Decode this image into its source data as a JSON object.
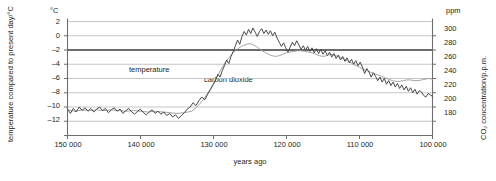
{
  "chart_data": {
    "type": "line",
    "title": "",
    "xlabel": "years ago",
    "x_tick_labels": [
      "150 000",
      "140 000",
      "130 000",
      "120 000",
      "110 000",
      "100 000"
    ],
    "x_ticks": [
      150000,
      140000,
      130000,
      120000,
      110000,
      100000
    ],
    "xlim": [
      150000,
      100000
    ],
    "x_direction": "decreasing",
    "grid": true,
    "legend_position": "inline-annotations",
    "axes": {
      "left": {
        "unit": "°C",
        "label": "temperature compared to present day/°C",
        "tick_labels": [
          "2",
          "0",
          "–2",
          "–4",
          "–6",
          "–8",
          "–10",
          "–12"
        ],
        "ticks": [
          2,
          0,
          -2,
          -4,
          -6,
          -8,
          -10,
          -12
        ],
        "ylim": [
          -12,
          4
        ]
      },
      "right": {
        "unit": "ppm",
        "label": "CO₂ concentration/p.p.m.",
        "tick_labels": [
          "300",
          "280",
          "260",
          "240",
          "220",
          "200",
          "180"
        ],
        "ticks": [
          300,
          280,
          260,
          240,
          220,
          200,
          180
        ],
        "ylim": [
          160,
          320
        ]
      }
    },
    "annotations": [
      {
        "text": "temperature",
        "x": 133000,
        "y": -4.2
      },
      {
        "text": "carbon dioxide",
        "x": 128400,
        "y": -5.0
      }
    ],
    "series": [
      {
        "name": "temperature",
        "unit": "°C",
        "axis": "left",
        "color": "#4a4a4a",
        "points": [
          [
            150000,
            -8.3
          ],
          [
            149600,
            -8.9
          ],
          [
            149200,
            -8.2
          ],
          [
            148800,
            -8.7
          ],
          [
            148400,
            -8.0
          ],
          [
            148000,
            -8.5
          ],
          [
            147600,
            -8.1
          ],
          [
            147200,
            -8.6
          ],
          [
            146800,
            -8.2
          ],
          [
            146400,
            -8.7
          ],
          [
            146000,
            -8.3
          ],
          [
            145600,
            -8.0
          ],
          [
            145200,
            -8.5
          ],
          [
            144800,
            -8.2
          ],
          [
            144400,
            -8.8
          ],
          [
            144000,
            -8.4
          ],
          [
            143600,
            -8.1
          ],
          [
            143200,
            -8.6
          ],
          [
            142800,
            -8.3
          ],
          [
            142400,
            -8.9
          ],
          [
            142000,
            -8.5
          ],
          [
            141600,
            -8.2
          ],
          [
            141200,
            -8.7
          ],
          [
            140800,
            -9.0
          ],
          [
            140400,
            -8.6
          ],
          [
            140000,
            -8.3
          ],
          [
            139600,
            -8.8
          ],
          [
            139200,
            -9.1
          ],
          [
            138800,
            -8.7
          ],
          [
            138400,
            -8.4
          ],
          [
            138000,
            -8.9
          ],
          [
            137600,
            -8.6
          ],
          [
            137200,
            -9.0
          ],
          [
            136800,
            -8.7
          ],
          [
            136400,
            -9.2
          ],
          [
            136000,
            -8.9
          ],
          [
            135600,
            -9.4
          ],
          [
            135200,
            -9.1
          ],
          [
            134800,
            -9.6
          ],
          [
            134400,
            -9.2
          ],
          [
            134000,
            -8.8
          ],
          [
            133600,
            -8.3
          ],
          [
            133200,
            -8.0
          ],
          [
            132800,
            -7.4
          ],
          [
            132400,
            -7.8
          ],
          [
            132000,
            -7.1
          ],
          [
            131600,
            -6.6
          ],
          [
            131200,
            -7.0
          ],
          [
            130800,
            -6.2
          ],
          [
            130400,
            -5.5
          ],
          [
            130000,
            -4.8
          ],
          [
            129700,
            -4.2
          ],
          [
            129400,
            -3.4
          ],
          [
            129100,
            -3.8
          ],
          [
            128800,
            -2.9
          ],
          [
            128500,
            -2.2
          ],
          [
            128200,
            -1.4
          ],
          [
            127900,
            -1.9
          ],
          [
            127600,
            -0.9
          ],
          [
            127300,
            -0.2
          ],
          [
            127000,
            0.6
          ],
          [
            126700,
            1.4
          ],
          [
            126400,
            0.8
          ],
          [
            126100,
            1.9
          ],
          [
            125800,
            2.6
          ],
          [
            125500,
            2.1
          ],
          [
            125200,
            2.9
          ],
          [
            124900,
            2.3
          ],
          [
            124600,
            3.1
          ],
          [
            124300,
            2.5
          ],
          [
            124000,
            1.9
          ],
          [
            123700,
            2.6
          ],
          [
            123400,
            3.0
          ],
          [
            123100,
            2.3
          ],
          [
            122800,
            2.8
          ],
          [
            122500,
            2.2
          ],
          [
            122200,
            2.7
          ],
          [
            121900,
            2.0
          ],
          [
            121600,
            2.5
          ],
          [
            121300,
            1.7
          ],
          [
            121000,
            1.1
          ],
          [
            120700,
            0.5
          ],
          [
            120400,
            1.0
          ],
          [
            120100,
            0.3
          ],
          [
            119800,
            -0.3
          ],
          [
            119500,
            0.4
          ],
          [
            119200,
            1.1
          ],
          [
            118900,
            0.6
          ],
          [
            118600,
            1.3
          ],
          [
            118300,
            0.7
          ],
          [
            118000,
            0.1
          ],
          [
            117700,
            0.6
          ],
          [
            117400,
            0.0
          ],
          [
            117100,
            0.5
          ],
          [
            116800,
            -0.2
          ],
          [
            116500,
            0.3
          ],
          [
            116200,
            -0.4
          ],
          [
            115900,
            0.2
          ],
          [
            115600,
            -0.5
          ],
          [
            115300,
            0.1
          ],
          [
            115000,
            -0.6
          ],
          [
            114700,
            -0.1
          ],
          [
            114400,
            -0.8
          ],
          [
            114100,
            -0.3
          ],
          [
            113800,
            -1.0
          ],
          [
            113500,
            -0.5
          ],
          [
            113200,
            -1.2
          ],
          [
            112900,
            -0.7
          ],
          [
            112600,
            -1.4
          ],
          [
            112300,
            -0.9
          ],
          [
            112000,
            -1.6
          ],
          [
            111700,
            -1.1
          ],
          [
            111400,
            -1.8
          ],
          [
            111100,
            -1.3
          ],
          [
            110800,
            -2.0
          ],
          [
            110500,
            -1.5
          ],
          [
            110200,
            -2.2
          ],
          [
            109900,
            -1.7
          ],
          [
            109600,
            -2.4
          ],
          [
            109300,
            -3.3
          ],
          [
            109000,
            -2.6
          ],
          [
            108700,
            -3.1
          ],
          [
            108400,
            -3.8
          ],
          [
            108100,
            -3.2
          ],
          [
            107800,
            -3.7
          ],
          [
            107500,
            -4.3
          ],
          [
            107200,
            -3.8
          ],
          [
            106900,
            -4.5
          ],
          [
            106600,
            -4.0
          ],
          [
            106300,
            -4.8
          ],
          [
            106000,
            -4.3
          ],
          [
            105700,
            -5.0
          ],
          [
            105400,
            -4.5
          ],
          [
            105100,
            -5.2
          ],
          [
            104800,
            -4.7
          ],
          [
            104500,
            -5.4
          ],
          [
            104200,
            -4.9
          ],
          [
            103900,
            -5.6
          ],
          [
            103600,
            -5.1
          ],
          [
            103300,
            -5.8
          ],
          [
            103000,
            -5.3
          ],
          [
            102700,
            -6.0
          ],
          [
            102400,
            -5.5
          ],
          [
            102100,
            -6.2
          ],
          [
            101800,
            -5.7
          ],
          [
            101500,
            -5.9
          ],
          [
            101200,
            -6.4
          ],
          [
            100900,
            -6.6
          ],
          [
            100600,
            -6.1
          ],
          [
            100300,
            -6.3
          ],
          [
            100000,
            -6.5
          ]
        ]
      },
      {
        "name": "carbon dioxide",
        "unit": "p.p.m.",
        "axis": "right",
        "color": "#9a9a9a",
        "points": [
          [
            150000,
            196
          ],
          [
            149000,
            194
          ],
          [
            148000,
            196
          ],
          [
            147000,
            195
          ],
          [
            146000,
            196
          ],
          [
            145000,
            195
          ],
          [
            144000,
            196
          ],
          [
            143000,
            195
          ],
          [
            142000,
            194
          ],
          [
            141000,
            195
          ],
          [
            140000,
            194
          ],
          [
            139000,
            193
          ],
          [
            138000,
            194
          ],
          [
            137000,
            193
          ],
          [
            136000,
            192
          ],
          [
            135000,
            191
          ],
          [
            134000,
            192
          ],
          [
            133000,
            194
          ],
          [
            132500,
            198
          ],
          [
            132000,
            203
          ],
          [
            131500,
            209
          ],
          [
            131000,
            216
          ],
          [
            130500,
            224
          ],
          [
            130000,
            233
          ],
          [
            129500,
            243
          ],
          [
            129000,
            252
          ],
          [
            128500,
            261
          ],
          [
            128000,
            268
          ],
          [
            127500,
            274
          ],
          [
            127000,
            279
          ],
          [
            126500,
            283
          ],
          [
            126000,
            286
          ],
          [
            125500,
            288
          ],
          [
            125000,
            289
          ],
          [
            124500,
            287
          ],
          [
            124000,
            284
          ],
          [
            123500,
            280
          ],
          [
            123000,
            277
          ],
          [
            122500,
            274
          ],
          [
            122000,
            272
          ],
          [
            121500,
            271
          ],
          [
            121000,
            272
          ],
          [
            120500,
            274
          ],
          [
            120000,
            276
          ],
          [
            119500,
            277
          ],
          [
            119000,
            278
          ],
          [
            118500,
            279
          ],
          [
            118000,
            279
          ],
          [
            117500,
            278
          ],
          [
            117000,
            277
          ],
          [
            116500,
            276
          ],
          [
            116000,
            274
          ],
          [
            115500,
            272
          ],
          [
            115000,
            271
          ],
          [
            114500,
            272
          ],
          [
            114000,
            274
          ],
          [
            113500,
            273
          ],
          [
            113000,
            271
          ],
          [
            112500,
            269
          ],
          [
            112000,
            267
          ],
          [
            111500,
            264
          ],
          [
            111000,
            261
          ],
          [
            110500,
            258
          ],
          [
            110000,
            256
          ],
          [
            109500,
            253
          ],
          [
            109000,
            251
          ],
          [
            108500,
            249
          ],
          [
            108000,
            247
          ],
          [
            107500,
            245
          ],
          [
            107000,
            243
          ],
          [
            106500,
            241
          ],
          [
            106000,
            239
          ],
          [
            105500,
            237
          ],
          [
            105000,
            236
          ],
          [
            104500,
            236
          ],
          [
            104000,
            237
          ],
          [
            103500,
            238
          ],
          [
            103000,
            238
          ],
          [
            102500,
            237
          ],
          [
            102000,
            237
          ],
          [
            101500,
            238
          ],
          [
            101000,
            239
          ],
          [
            100500,
            240
          ],
          [
            100000,
            239
          ]
        ]
      }
    ]
  }
}
